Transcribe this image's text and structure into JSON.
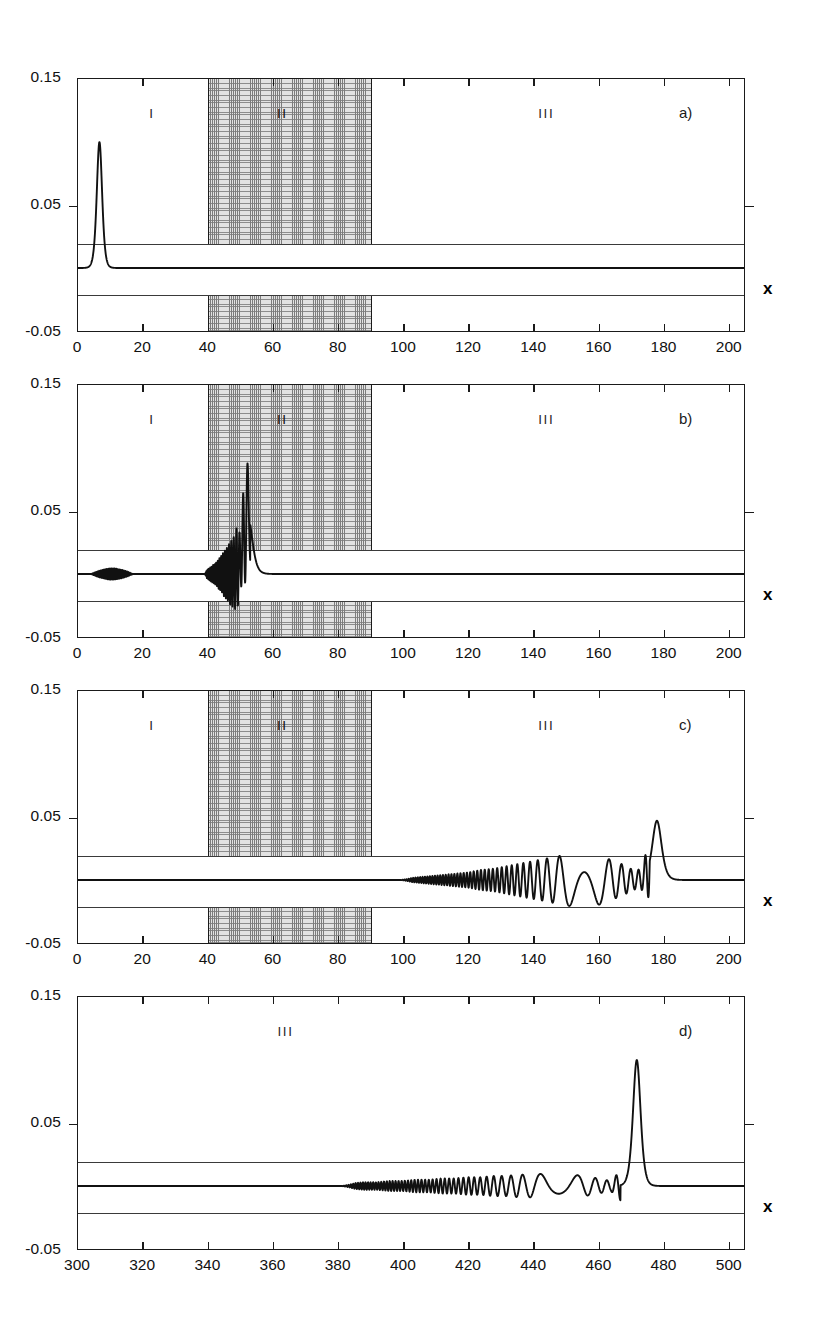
{
  "figure": {
    "axis_x_name": "x",
    "y_axis": {
      "ticks": [
        "0.15",
        "0.05",
        "-0.05"
      ],
      "tick_values": [
        0.15,
        0.05,
        -0.05
      ],
      "min": -0.05,
      "max": 0.15
    },
    "region_labels": {
      "one": "I",
      "two": "II",
      "three": "III"
    },
    "panel_tags": {
      "a": "a)",
      "b": "b)",
      "c": "c)",
      "d": "d)"
    },
    "colors": {
      "axis": "#1a1a1a",
      "curve": "#111111",
      "shade_fill": "#e2e2e2",
      "shade_hatch": "#7c7c7c",
      "refline": "#3a3a3a",
      "background": "#ffffff"
    }
  },
  "panels": {
    "a": {
      "tag": "a)",
      "xticks": [
        "0",
        "20",
        "40",
        "60",
        "80",
        "100",
        "120",
        "140",
        "160",
        "180",
        "200"
      ],
      "xtick_values": [
        0,
        20,
        40,
        60,
        80,
        100,
        120,
        140,
        160,
        180,
        200
      ],
      "xlim": [
        0,
        205
      ],
      "shaded_region": [
        40,
        90
      ],
      "region_label_positions": {
        "one": 23,
        "two": 63,
        "three": 144
      }
    },
    "b": {
      "tag": "b)",
      "xticks": [
        "0",
        "20",
        "40",
        "60",
        "80",
        "100",
        "120",
        "140",
        "160",
        "180",
        "200"
      ],
      "xtick_values": [
        0,
        20,
        40,
        60,
        80,
        100,
        120,
        140,
        160,
        180,
        200
      ],
      "xlim": [
        0,
        205
      ],
      "shaded_region": [
        40,
        90
      ],
      "region_label_positions": {
        "one": 23,
        "two": 63,
        "three": 144
      }
    },
    "c": {
      "tag": "c)",
      "xticks": [
        "0",
        "20",
        "40",
        "60",
        "80",
        "100",
        "120",
        "140",
        "160",
        "180",
        "200"
      ],
      "xtick_values": [
        0,
        20,
        40,
        60,
        80,
        100,
        120,
        140,
        160,
        180,
        200
      ],
      "xlim": [
        0,
        205
      ],
      "shaded_region": [
        40,
        90
      ],
      "region_label_positions": {
        "one": 23,
        "two": 63,
        "three": 144
      }
    },
    "d": {
      "tag": "d)",
      "xticks": [
        "300",
        "320",
        "340",
        "360",
        "380",
        "400",
        "420",
        "440",
        "460",
        "480",
        "500"
      ],
      "xtick_values": [
        300,
        320,
        340,
        360,
        380,
        400,
        420,
        440,
        460,
        480,
        500
      ],
      "xlim": [
        300,
        505
      ],
      "shaded_region": null,
      "region_label_positions": {
        "three": 364
      }
    }
  },
  "chart_data": {
    "type": "line",
    "title": "",
    "xlabel": "x",
    "ylabel": "",
    "ylim": [
      -0.05,
      0.15
    ],
    "grid": false,
    "legend": null,
    "reference_lines": [
      0.02,
      -0.02
    ],
    "baseline": 0.0,
    "annotations": [
      {
        "text": "I",
        "panel": "a",
        "x": 23,
        "y": 0.132
      },
      {
        "text": "II",
        "panel": "a",
        "x": 63,
        "y": 0.132
      },
      {
        "text": "III",
        "panel": "a",
        "x": 144,
        "y": 0.132
      },
      {
        "text": "a)",
        "panel": "a",
        "x": 185,
        "y": 0.132
      },
      {
        "text": "I",
        "panel": "b",
        "x": 23,
        "y": 0.132
      },
      {
        "text": "II",
        "panel": "b",
        "x": 63,
        "y": 0.132
      },
      {
        "text": "III",
        "panel": "b",
        "x": 144,
        "y": 0.132
      },
      {
        "text": "b)",
        "panel": "b",
        "x": 185,
        "y": 0.132
      },
      {
        "text": "I",
        "panel": "c",
        "x": 23,
        "y": 0.132
      },
      {
        "text": "II",
        "panel": "c",
        "x": 63,
        "y": 0.132
      },
      {
        "text": "III",
        "panel": "c",
        "x": 144,
        "y": 0.132
      },
      {
        "text": "c)",
        "panel": "c",
        "x": 185,
        "y": 0.132
      },
      {
        "text": "III",
        "panel": "d",
        "x": 364,
        "y": 0.132
      },
      {
        "text": "d)",
        "panel": "d",
        "x": 485,
        "y": 0.132
      }
    ],
    "shaded_regions": [
      {
        "panel": "a",
        "xrange": [
          40,
          90
        ],
        "label": "II"
      },
      {
        "panel": "b",
        "xrange": [
          40,
          90
        ],
        "label": "II"
      },
      {
        "panel": "c",
        "xrange": [
          40,
          90
        ],
        "label": "II"
      }
    ],
    "series": [
      {
        "name": "a",
        "panel": "a",
        "xlim": [
          0,
          205
        ],
        "description": "narrow incident pulse in region I peaking near x=6.5 at amplitude 0.10, flat elsewhere",
        "x": [
          0,
          2,
          4,
          5,
          5.5,
          6,
          6.3,
          6.6,
          7,
          7.4,
          8,
          9,
          10,
          12,
          16,
          20,
          30,
          40,
          50,
          60,
          70,
          80,
          90,
          100,
          120,
          140,
          160,
          180,
          200,
          205
        ],
        "y": [
          0.0,
          0.0,
          0.001,
          0.004,
          0.015,
          0.055,
          0.085,
          0.1,
          0.062,
          0.022,
          0.005,
          0.001,
          0.0,
          0.0,
          0.0,
          0.0,
          0.0,
          0.0,
          0.0,
          0.0,
          0.0,
          0.0,
          0.0,
          0.0,
          0.0,
          0.0,
          0.0,
          0.0,
          0.0,
          0.0
        ]
      },
      {
        "name": "b",
        "panel": "b",
        "xlim": [
          0,
          205
        ],
        "description": "small ripples near x=5-16 in region I; strong rapidly oscillating packet from x=40 growing to a sharp peak 0.045 at x=52 then decaying to flat after x=57",
        "x": [
          0,
          3,
          5,
          6,
          7,
          8,
          9,
          10,
          11,
          12,
          13,
          14,
          15,
          16,
          18,
          22,
          30,
          36,
          38,
          40,
          41,
          42,
          43,
          44,
          45,
          46,
          47,
          48,
          49,
          50,
          51,
          52,
          53,
          54,
          55,
          56,
          57,
          60,
          70,
          80,
          90,
          100,
          120,
          140,
          160,
          180,
          200,
          205
        ],
        "y": [
          0.0,
          0.0,
          0.002,
          -0.003,
          0.003,
          -0.004,
          0.003,
          -0.003,
          0.004,
          0.006,
          0.004,
          -0.002,
          0.002,
          0.0,
          0.0,
          0.0,
          0.0,
          0.0,
          0.001,
          0.004,
          -0.006,
          0.008,
          -0.011,
          0.014,
          -0.018,
          0.021,
          -0.026,
          0.028,
          -0.034,
          0.02,
          -0.043,
          0.045,
          0.03,
          0.016,
          0.007,
          0.002,
          0.0,
          0.0,
          0.0,
          0.0,
          0.0,
          0.0,
          0.0,
          0.0,
          0.0,
          0.0,
          0.0,
          0.0
        ]
      },
      {
        "name": "c",
        "panel": "c",
        "xlim": [
          0,
          205
        ],
        "description": "flat through regions I and II; oscillations begin near x=100 in region III, amplitude grows steadily to ~0.022 by x=155, wavelength lengthens past x=160, final sharp peak 0.047 at x=178, flat after x=182",
        "x": [
          0,
          20,
          40,
          55,
          60,
          80,
          90,
          95,
          100,
          104,
          108,
          112,
          116,
          120,
          124,
          128,
          132,
          136,
          140,
          144,
          148,
          152,
          156,
          160,
          164,
          166,
          168,
          170,
          172,
          174,
          176,
          177,
          178,
          179,
          180,
          181,
          182,
          185,
          190,
          200,
          205
        ],
        "y": [
          0.0,
          0.0,
          0.0,
          -0.001,
          0.0,
          0.0,
          0.0,
          0.0,
          0.001,
          -0.002,
          0.003,
          -0.004,
          0.005,
          -0.006,
          0.008,
          -0.009,
          0.011,
          -0.013,
          0.015,
          -0.017,
          0.019,
          -0.021,
          0.022,
          -0.02,
          0.016,
          -0.014,
          0.012,
          0.009,
          -0.007,
          0.01,
          0.028,
          0.042,
          0.047,
          0.035,
          0.012,
          0.002,
          0.0,
          0.0,
          0.0,
          0.0,
          0.0
        ]
      },
      {
        "name": "d",
        "panel": "d",
        "xlim": [
          300,
          505
        ],
        "description": "flat from x=300 to ~380; low amplitude ripples from x=382 growing slowly, wavelength lengthening after x=450, sharp tall peak 0.100 at x=472, flat after x=477",
        "x": [
          300,
          320,
          340,
          360,
          375,
          380,
          384,
          388,
          392,
          396,
          400,
          404,
          408,
          412,
          416,
          420,
          424,
          428,
          432,
          436,
          440,
          444,
          448,
          452,
          456,
          460,
          464,
          467,
          469,
          470,
          471,
          472,
          473,
          474,
          475,
          476,
          477,
          480,
          490,
          500,
          505
        ],
        "y": [
          0.0,
          0.0,
          0.0,
          0.0,
          0.0,
          0.001,
          -0.002,
          0.003,
          -0.003,
          0.004,
          -0.004,
          0.005,
          -0.005,
          0.006,
          -0.006,
          0.007,
          -0.007,
          0.008,
          -0.008,
          0.009,
          -0.009,
          0.01,
          -0.01,
          0.009,
          -0.008,
          0.006,
          0.004,
          0.012,
          0.04,
          0.075,
          0.095,
          0.1,
          0.08,
          0.04,
          0.012,
          0.003,
          0.0,
          0.0,
          0.0,
          0.0,
          0.0
        ]
      }
    ]
  }
}
